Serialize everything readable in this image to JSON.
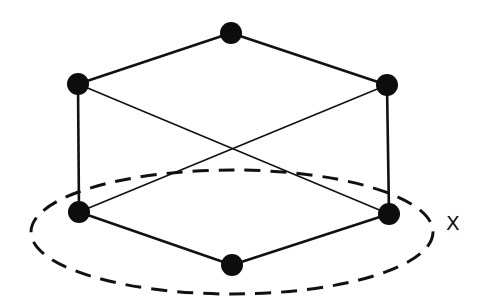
{
  "diagram": {
    "type": "hasse-diagram",
    "nodes": [
      {
        "id": "top",
        "x": 231,
        "y": 33
      },
      {
        "id": "upper-left",
        "x": 78,
        "y": 84
      },
      {
        "id": "upper-right",
        "x": 387,
        "y": 85
      },
      {
        "id": "lower-left",
        "x": 79,
        "y": 212
      },
      {
        "id": "lower-right",
        "x": 389,
        "y": 214
      },
      {
        "id": "bottom",
        "x": 232,
        "y": 265
      }
    ],
    "edges": [
      {
        "from": "top",
        "to": "upper-left"
      },
      {
        "from": "top",
        "to": "upper-right"
      },
      {
        "from": "upper-left",
        "to": "lower-left"
      },
      {
        "from": "upper-right",
        "to": "lower-right"
      },
      {
        "from": "upper-left",
        "to": "lower-right"
      },
      {
        "from": "upper-right",
        "to": "lower-left"
      },
      {
        "from": "lower-left",
        "to": "bottom"
      },
      {
        "from": "lower-right",
        "to": "bottom"
      }
    ],
    "dashed_ellipse": {
      "cx": 232,
      "cy": 232,
      "rx": 201,
      "ry": 62,
      "label": "X"
    }
  }
}
